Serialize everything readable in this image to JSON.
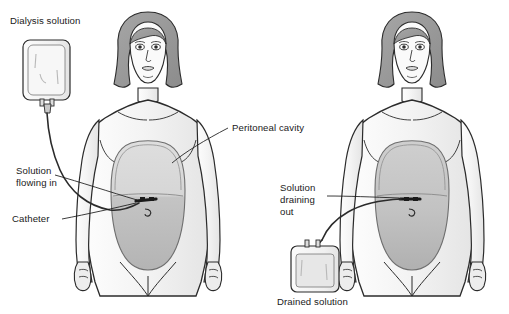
{
  "figure": {
    "background_color": "#ffffff",
    "line_color": "#1a1a1a",
    "label_color": "#1a1a1a"
  },
  "labels": {
    "dialysis_solution": "Dialysis solution",
    "solution_flowing_in_line1": "Solution",
    "solution_flowing_in_line2": "flowing in",
    "catheter": "Catheter",
    "peritoneal_cavity": "Peritoneal cavity",
    "solution_draining_out_line1": "Solution",
    "solution_draining_out_line2": "draining",
    "solution_draining_out_line3": "out",
    "drained_solution": "Drained solution"
  },
  "colors": {
    "skin_fill": "#f2f2f2",
    "skin_shade": "#e2e2e2",
    "hair_fill": "#9a9a9a",
    "cavity_fill_light": "#d4d4d4",
    "cavity_fill_dark": "#b9b9b9",
    "bag_fill": "#f6f6f6",
    "bag_fluid": "#e6e6e6",
    "outline": "#2b2b2b",
    "tube": "#3a3a3a"
  },
  "panels": [
    {
      "id": "left-panel",
      "name": "infusion-phase",
      "description": "Dialysis solution bag hung above, tube running into the abdomen, peritoneal cavity partially filled",
      "bag_position": "upper-left",
      "bag_label": "Dialysis solution",
      "flow_direction": "in"
    },
    {
      "id": "right-panel",
      "name": "drain-phase",
      "description": "Peritoneal cavity draining through catheter into a collection bag placed low",
      "bag_position": "lower-left-of-figure",
      "bag_label": "Drained solution",
      "flow_direction": "out"
    }
  ],
  "bottom_caption": ""
}
